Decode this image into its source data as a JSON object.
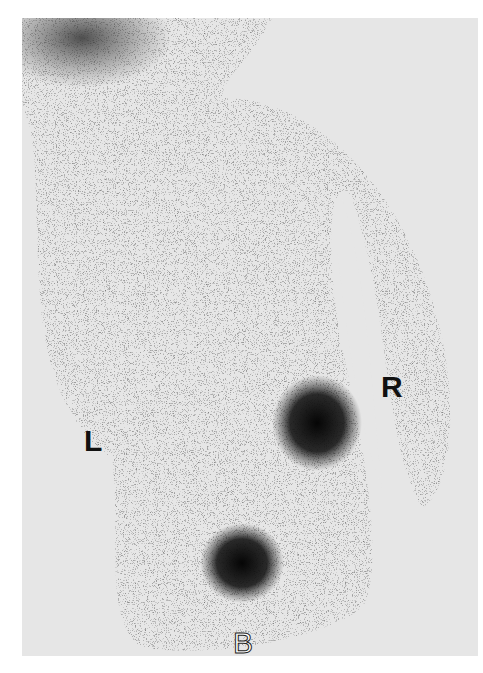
{
  "image": {
    "type": "scintigraphy scan (grayscale)",
    "labels": {
      "left": "L",
      "right": "R",
      "bottom": "B"
    },
    "colors": {
      "background": "#e6e6e6",
      "activity_dark": "#111111",
      "page": "#ffffff"
    }
  }
}
